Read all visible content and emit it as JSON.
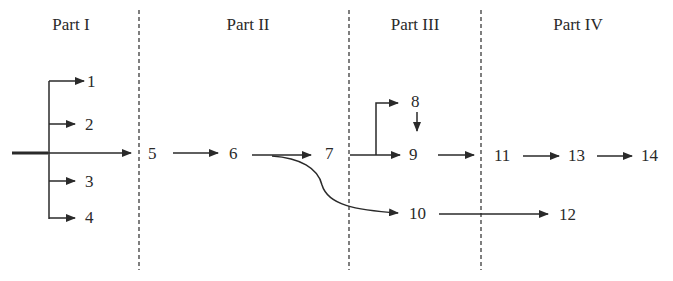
{
  "parts": [
    {
      "label": "Part I"
    },
    {
      "label": "Part II"
    },
    {
      "label": "Part III"
    },
    {
      "label": "Part IV"
    }
  ],
  "nodes": {
    "n1": "1",
    "n2": "2",
    "n3": "3",
    "n4": "4",
    "n5": "5",
    "n6": "6",
    "n7": "7",
    "n8": "8",
    "n9": "9",
    "n10": "10",
    "n11": "11",
    "n12": "12",
    "n13": "13",
    "n14": "14"
  },
  "edges": [
    [
      "source",
      "1"
    ],
    [
      "source",
      "2"
    ],
    [
      "source",
      "3"
    ],
    [
      "source",
      "4"
    ],
    [
      "source",
      "5"
    ],
    [
      "5",
      "6"
    ],
    [
      "6",
      "7"
    ],
    [
      "6",
      "10"
    ],
    [
      "7",
      "8"
    ],
    [
      "7",
      "9"
    ],
    [
      "8",
      "9"
    ],
    [
      "9",
      "11"
    ],
    [
      "10",
      "12"
    ],
    [
      "11",
      "13"
    ],
    [
      "13",
      "14"
    ]
  ],
  "colors": {
    "ink": "#2a2a2a",
    "background": "#ffffff"
  }
}
